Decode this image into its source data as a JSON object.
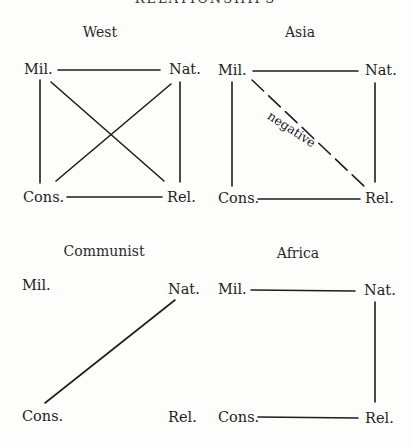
{
  "figure": {
    "title_partial": "RELATIONSHIPS",
    "node_labels": {
      "mil": "Mil.",
      "nat": "Nat.",
      "cons": "Cons.",
      "rel": "Rel."
    },
    "panels": [
      {
        "name": "West",
        "edges": [
          {
            "from": "Mil.",
            "to": "Nat.",
            "style": "solid"
          },
          {
            "from": "Mil.",
            "to": "Cons.",
            "style": "solid"
          },
          {
            "from": "Nat.",
            "to": "Rel.",
            "style": "solid"
          },
          {
            "from": "Cons.",
            "to": "Rel.",
            "style": "solid"
          },
          {
            "from": "Mil.",
            "to": "Rel.",
            "style": "solid"
          },
          {
            "from": "Nat.",
            "to": "Cons.",
            "style": "solid"
          }
        ]
      },
      {
        "name": "Asia",
        "edges": [
          {
            "from": "Mil.",
            "to": "Nat.",
            "style": "solid"
          },
          {
            "from": "Mil.",
            "to": "Cons.",
            "style": "solid"
          },
          {
            "from": "Nat.",
            "to": "Rel.",
            "style": "solid"
          },
          {
            "from": "Cons.",
            "to": "Rel.",
            "style": "solid"
          },
          {
            "from": "Mil.",
            "to": "Rel.",
            "style": "dashed",
            "label": "negative"
          }
        ]
      },
      {
        "name": "Communist",
        "edges": [
          {
            "from": "Nat.",
            "to": "Cons.",
            "style": "solid"
          }
        ]
      },
      {
        "name": "Africa",
        "edges": [
          {
            "from": "Mil.",
            "to": "Nat.",
            "style": "solid"
          },
          {
            "from": "Nat.",
            "to": "Rel.",
            "style": "solid"
          },
          {
            "from": "Cons.",
            "to": "Rel.",
            "style": "solid"
          }
        ]
      }
    ]
  }
}
